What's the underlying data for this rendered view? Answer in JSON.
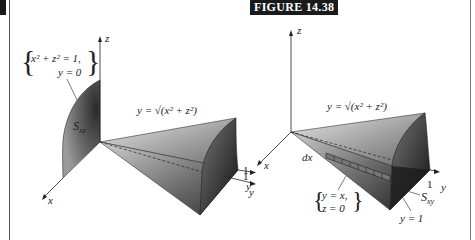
{
  "figure": {
    "label": "FIGURE 14.38"
  },
  "left_panel": {
    "axes": {
      "z": "z",
      "x": "x",
      "y": "y"
    },
    "tick_y": "1",
    "surface_label": "S",
    "surface_sub": "xz",
    "curve_label_line1": "x² + z² = 1,",
    "curve_label_line2": "y = 0",
    "cone_equation": "y = √(x² + z²)"
  },
  "right_panel": {
    "axes": {
      "z": "z",
      "x": "x",
      "y": "y"
    },
    "tick_y": "1",
    "tick_y_left": "1",
    "surface_label": "S",
    "surface_sub": "xy",
    "line_label_line1": "y = x,",
    "line_label_line2": "z = 0",
    "differential": "dx",
    "plane_label": "y = 1",
    "cone_equation": "y = √(x² + z²)"
  },
  "colors": {
    "label_bg": "#1a1a1a",
    "label_fg": "#ffffff",
    "frame": "#555555"
  }
}
